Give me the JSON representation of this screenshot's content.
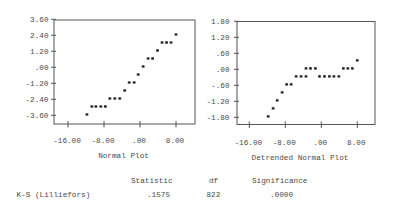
{
  "chart_data": [
    {
      "type": "scatter",
      "title": "Normal Plot",
      "xlabel": "",
      "ylabel": "",
      "marker": "*",
      "grid": false,
      "x_ticks": [
        -16,
        -8,
        0,
        8
      ],
      "x_tick_labels": [
        "-16.00",
        "-8.00",
        ".00",
        "8.00"
      ],
      "y_ticks": [
        3.6,
        2.4,
        1.2,
        0,
        -1.2,
        -2.4,
        -3.6
      ],
      "y_tick_labels": [
        "3.60",
        "2.40",
        "1.20",
        ".00",
        "-1.20",
        "-2.40",
        "-3.60"
      ],
      "xlim": [
        -19.1,
        12.2
      ],
      "ylim": [
        -4.25,
        3.6
      ],
      "points": [
        {
          "x": -11.8,
          "y": -3.6
        },
        {
          "x": -10.7,
          "y": -3.0
        },
        {
          "x": -9.8,
          "y": -3.0
        },
        {
          "x": -8.7,
          "y": -3.0
        },
        {
          "x": -7.7,
          "y": -3.0
        },
        {
          "x": -6.7,
          "y": -2.4
        },
        {
          "x": -5.6,
          "y": -2.4
        },
        {
          "x": -4.5,
          "y": -2.4
        },
        {
          "x": -3.4,
          "y": -1.8
        },
        {
          "x": -2.4,
          "y": -1.2
        },
        {
          "x": -1.3,
          "y": -1.2
        },
        {
          "x": -0.4,
          "y": -0.6
        },
        {
          "x": 0.7,
          "y": 0.0
        },
        {
          "x": 1.8,
          "y": 0.6
        },
        {
          "x": 2.8,
          "y": 0.6
        },
        {
          "x": 3.9,
          "y": 1.2
        },
        {
          "x": 4.9,
          "y": 1.8
        },
        {
          "x": 5.9,
          "y": 1.8
        },
        {
          "x": 6.9,
          "y": 1.8
        },
        {
          "x": 8.0,
          "y": 2.4
        }
      ]
    },
    {
      "type": "scatter",
      "title": "Detrended Normal Plot",
      "xlabel": "",
      "ylabel": "",
      "marker": "*",
      "grid": false,
      "x_ticks": [
        -16,
        -8,
        0,
        8
      ],
      "x_tick_labels": [
        "-16.00",
        "-8.00",
        ".00",
        "8.00"
      ],
      "y_ticks": [
        1.8,
        1.2,
        0.6,
        0,
        -0.6,
        -1.2,
        -1.8
      ],
      "y_tick_labels": [
        "1.80",
        "1.20",
        ".60",
        ".00",
        "-.60",
        "-1.20",
        "-1.80"
      ],
      "xlim": [
        -18.7,
        11.9
      ],
      "ylim": [
        -2.07,
        1.8
      ],
      "points": [
        {
          "x": -11.8,
          "y": -1.8
        },
        {
          "x": -10.7,
          "y": -1.5
        },
        {
          "x": -9.8,
          "y": -1.2
        },
        {
          "x": -8.7,
          "y": -0.9
        },
        {
          "x": -7.7,
          "y": -0.6
        },
        {
          "x": -6.7,
          "y": -0.6
        },
        {
          "x": -5.6,
          "y": -0.3
        },
        {
          "x": -4.5,
          "y": -0.3
        },
        {
          "x": -3.4,
          "y": -0.3
        },
        {
          "x": -3.4,
          "y": 0.0
        },
        {
          "x": -2.4,
          "y": 0.0
        },
        {
          "x": -1.3,
          "y": 0.0
        },
        {
          "x": -0.4,
          "y": -0.3
        },
        {
          "x": 0.7,
          "y": -0.3
        },
        {
          "x": 1.8,
          "y": -0.3
        },
        {
          "x": 2.8,
          "y": -0.3
        },
        {
          "x": 3.9,
          "y": -0.3
        },
        {
          "x": 4.9,
          "y": 0.0
        },
        {
          "x": 5.9,
          "y": 0.0
        },
        {
          "x": 6.9,
          "y": 0.0
        },
        {
          "x": 8.0,
          "y": 0.3
        }
      ]
    }
  ],
  "stats_table": {
    "headers": {
      "statistic": "Statistic",
      "df": "df",
      "significance": "Significance"
    },
    "rows": [
      {
        "label": "K-S (Lilliefors)",
        "statistic": ".1575",
        "df": "822",
        "significance": ".0000"
      }
    ]
  }
}
